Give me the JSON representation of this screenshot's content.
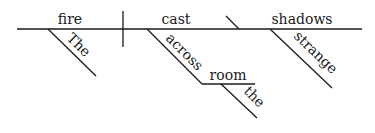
{
  "diagram": {
    "type": "sentence-diagram",
    "sentence": "The fire cast strange shadows across the room",
    "subject": {
      "word": "fire",
      "modifiers": [
        "The"
      ]
    },
    "predicate": {
      "word": "cast",
      "modifiers": [
        {
          "preposition": "across",
          "object": "room",
          "object_modifiers": [
            "the"
          ]
        }
      ]
    },
    "direct_object": {
      "word": "shadows",
      "modifiers": [
        "strange"
      ]
    },
    "words": {
      "fire": "fire",
      "the_cap": "The",
      "cast": "cast",
      "across": "across",
      "room": "room",
      "the_lower": "the",
      "shadows": "shadows",
      "strange": "strange"
    },
    "colors": {
      "ink": "#1a1a1a",
      "background": "#ffffff"
    }
  }
}
